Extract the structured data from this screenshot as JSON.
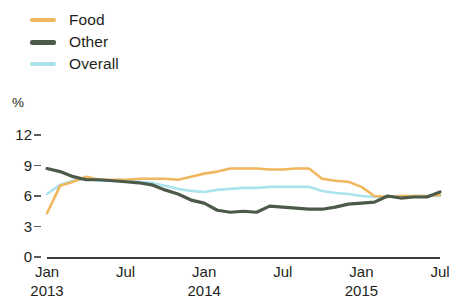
{
  "legend": {
    "items": [
      {
        "label": "Food",
        "color": "#f0b75e",
        "weight": "normal"
      },
      {
        "label": "Other",
        "color": "#4c5a4a",
        "weight": "thick"
      },
      {
        "label": "Overall",
        "color": "#aae3ee",
        "weight": "normal"
      }
    ]
  },
  "axis": {
    "unit": "%",
    "y_ticks": [
      "12",
      "9",
      "6",
      "3",
      "0"
    ],
    "x_ticks": [
      {
        "month": "Jan",
        "year": "2013"
      },
      {
        "month": "Jul",
        "year": ""
      },
      {
        "month": "Jan",
        "year": "2014"
      },
      {
        "month": "Jul",
        "year": ""
      },
      {
        "month": "Jan",
        "year": "2015"
      },
      {
        "month": "Jul",
        "year": ""
      }
    ]
  },
  "chart_data": {
    "type": "line",
    "title": "",
    "xlabel": "",
    "ylabel": "%",
    "ylim": [
      0,
      12
    ],
    "yticks": [
      0,
      3,
      6,
      9,
      12
    ],
    "grid": false,
    "legend_position": "top-left",
    "x": [
      "Jan 2013",
      "Feb 2013",
      "Mar 2013",
      "Apr 2013",
      "May 2013",
      "Jun 2013",
      "Jul 2013",
      "Aug 2013",
      "Sep 2013",
      "Oct 2013",
      "Nov 2013",
      "Dec 2013",
      "Jan 2014",
      "Feb 2014",
      "Mar 2014",
      "Apr 2014",
      "May 2014",
      "Jun 2014",
      "Jul 2014",
      "Aug 2014",
      "Sep 2014",
      "Oct 2014",
      "Nov 2014",
      "Dec 2014",
      "Jan 2015",
      "Feb 2015",
      "Mar 2015",
      "Apr 2015",
      "May 2015",
      "Jun 2015",
      "Jul 2015"
    ],
    "series": [
      {
        "name": "Food",
        "color": "#f0b75e",
        "values": [
          4.3,
          7.0,
          7.4,
          7.9,
          7.6,
          7.6,
          7.6,
          7.7,
          7.7,
          7.7,
          7.6,
          7.9,
          8.2,
          8.4,
          8.7,
          8.7,
          8.7,
          8.6,
          8.6,
          8.7,
          8.7,
          7.7,
          7.5,
          7.4,
          6.9,
          6.0,
          5.9,
          6.0,
          6.0,
          6.0,
          6.1
        ]
      },
      {
        "name": "Other",
        "color": "#4c5a4a",
        "values": [
          8.7,
          8.4,
          7.9,
          7.6,
          7.6,
          7.5,
          7.4,
          7.3,
          7.1,
          6.6,
          6.2,
          5.6,
          5.3,
          4.6,
          4.4,
          4.5,
          4.4,
          5.0,
          4.9,
          4.8,
          4.7,
          4.7,
          4.9,
          5.2,
          5.3,
          5.4,
          6.0,
          5.8,
          5.9,
          5.9,
          6.4
        ]
      },
      {
        "name": "Overall",
        "color": "#aae3ee",
        "values": [
          6.2,
          7.1,
          7.5,
          7.7,
          7.5,
          7.5,
          7.5,
          7.4,
          7.3,
          7.0,
          6.7,
          6.5,
          6.4,
          6.6,
          6.7,
          6.8,
          6.8,
          6.9,
          6.9,
          6.9,
          6.9,
          6.5,
          6.3,
          6.2,
          6.0,
          5.9,
          5.9,
          6.0,
          6.0,
          6.0,
          6.0
        ]
      }
    ]
  }
}
